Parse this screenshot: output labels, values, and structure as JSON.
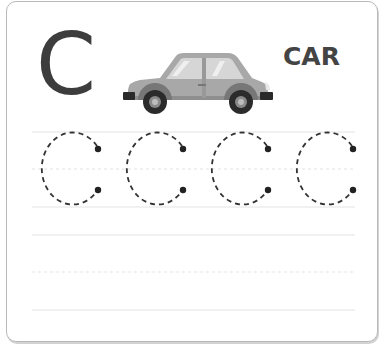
{
  "worksheet": {
    "letter": "C",
    "word": "CAR",
    "picture": "car-illustration",
    "trace_count": 4,
    "colors": {
      "letter": "#3d3d3d",
      "word": "#444444",
      "guide_line": "#e6e6e6",
      "trace_dash": "#333333",
      "border": "#b9b9b9",
      "car_body": "#a9a9a9"
    },
    "rows": [
      {
        "type": "trace",
        "top_y": 132,
        "mid_y": 169,
        "bottom_y": 207
      },
      {
        "type": "blank",
        "top_y": 235,
        "mid_y": 272,
        "bottom_y": 310
      }
    ]
  }
}
